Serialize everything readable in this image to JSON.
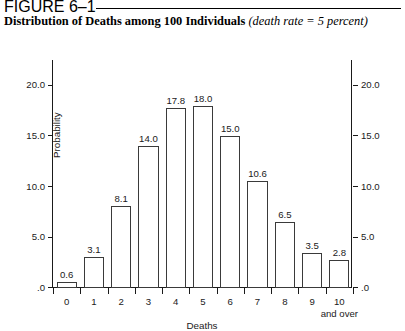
{
  "figure": {
    "number": "FIGURE 6–1",
    "title_main": "Distribution of Deaths among 100 Individuals",
    "title_sub": "(death rate = 5 percent)"
  },
  "chart_data": {
    "type": "bar",
    "title": "Distribution of Deaths among 100 Individuals (death rate = 5 percent)",
    "xlabel": "Deaths",
    "ylabel": "Probability",
    "categories": [
      "0",
      "1",
      "2",
      "3",
      "4",
      "5",
      "6",
      "7",
      "8",
      "9",
      "10"
    ],
    "category_labels_extra": {
      "10": "and over"
    },
    "values": [
      0.6,
      3.1,
      8.1,
      14.0,
      17.8,
      18.0,
      15.0,
      10.6,
      6.5,
      3.5,
      2.8
    ],
    "data_labels": [
      "0.6",
      "3.1",
      "8.1",
      "14.0",
      "17.8",
      "18.0",
      "15.0",
      "10.6",
      "6.5",
      "3.5",
      "2.8"
    ],
    "ylim": [
      0,
      22.5
    ],
    "yticks": [
      0,
      5,
      10,
      15,
      20
    ],
    "ytick_labels": [
      ".0",
      "5.0",
      "10.0",
      "15.0",
      "20.0"
    ],
    "grid": false,
    "legend": false,
    "right_axis_mirrored": true,
    "bar_fill": "#ffffff",
    "bar_edge": "#3a3a3a"
  }
}
